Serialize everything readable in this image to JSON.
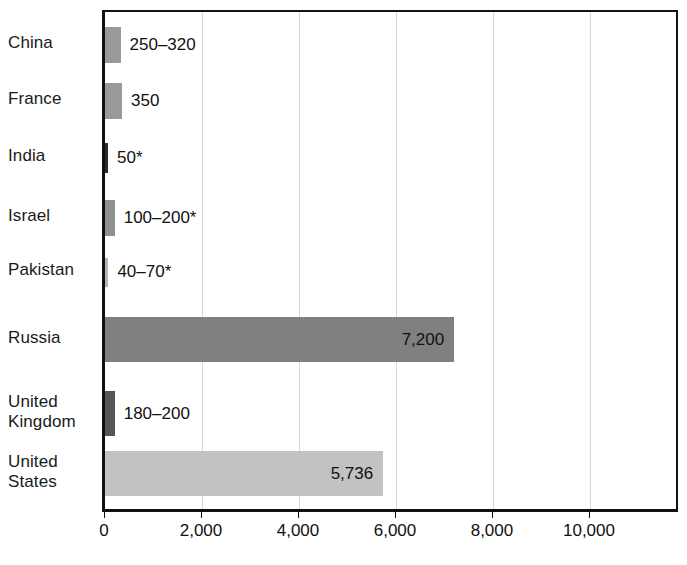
{
  "chart_data": {
    "type": "bar",
    "orientation": "horizontal",
    "title": "",
    "subtitle": "",
    "xlabel": "",
    "ylabel": "",
    "xlim": [
      0,
      11815
    ],
    "grid": "vertical",
    "legend": null,
    "xticks": [
      0,
      2000,
      4000,
      6000,
      8000,
      10000
    ],
    "xticklabels": [
      "0",
      "2,000",
      "4,000",
      "6,000",
      "8,000",
      "10,000"
    ],
    "categories": [
      "China",
      "France",
      "India",
      "Israel",
      "Pakistan",
      "Russia",
      "United\nKingdom",
      "United\nStates"
    ],
    "values": [
      320,
      350,
      50,
      200,
      70,
      7200,
      200,
      5736
    ],
    "labels": [
      "250–320",
      "350",
      "50*",
      "100–200*",
      "40–70*",
      "7,200",
      "180–200",
      "5,736"
    ],
    "label_placement": [
      "outside",
      "outside",
      "outside",
      "outside",
      "outside",
      "inside",
      "outside",
      "inside"
    ],
    "bar_colors": [
      "#9a9a9a",
      "#9a9a9a",
      "#2b2b2b",
      "#8f8f8f",
      "#b5b5b5",
      "#808080",
      "#565656",
      "#c2c2c2"
    ],
    "footnote": "*"
  },
  "axis": {
    "axis_color": "#111111",
    "grid_color": "#d8d8d8",
    "background": "#ffffff"
  }
}
